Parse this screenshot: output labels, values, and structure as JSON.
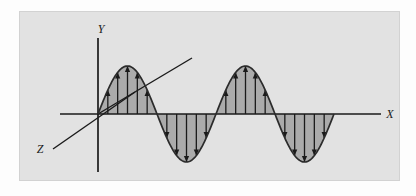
{
  "figure": {
    "name": "transverse-wave-diagram",
    "panel_background": "#e2e2e2",
    "panel_border": "#d2d2d2",
    "page_background": "#fdfdfd"
  },
  "axes": {
    "x": {
      "label": "X",
      "color": "#1a1a1a",
      "label_x": 390,
      "label_y": 118
    },
    "y": {
      "label": "Y",
      "color": "#1a1a1a",
      "label_x": 101,
      "label_y": 33
    },
    "z": {
      "label": "Z",
      "color": "#1a1a1a",
      "label_x": 40,
      "label_y": 153
    }
  },
  "wave": {
    "curve_color": "#2b2b2b",
    "fill_color": "#ababab",
    "arrow_color": "#1a1a1a",
    "amplitude": 48,
    "wavelength": 118,
    "cycles": 2,
    "origin_x": 98,
    "baseline_y": 114,
    "start_x": 98,
    "end_x": 334,
    "arrows_per_half_cycle": 5
  },
  "chart_data": {
    "type": "line",
    "title": "",
    "xlabel": "X",
    "ylabel": "Y",
    "series": [
      {
        "name": "transverse wave",
        "function": "y = A sin(2*pi*x/lambda)",
        "amplitude": 48,
        "wavelength": 118,
        "phase": 0
      }
    ],
    "annotations": [
      "X",
      "Y",
      "Z"
    ],
    "grid": false,
    "legend": "none"
  }
}
